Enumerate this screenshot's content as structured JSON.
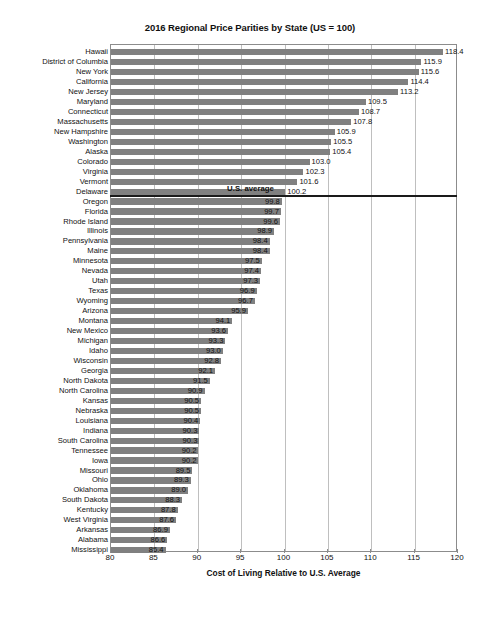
{
  "chart_data": {
    "type": "bar",
    "orientation": "horizontal",
    "title": "2016 Regional Price Parities by State (US = 100)",
    "xlabel": "Cost of Living Relative to U.S. Average",
    "ylabel": "",
    "xlim": [
      80,
      120
    ],
    "xticks": [
      80,
      85,
      90,
      95,
      100,
      105,
      110,
      115,
      120
    ],
    "grid": "vertical",
    "legend": "none",
    "bar_color": "#808080",
    "baseline": 80,
    "annotations": [
      {
        "text": "U.S. average",
        "value": 100,
        "type": "divider-line"
      }
    ],
    "categories": [
      "Hawaii",
      "District of Columbia",
      "New York",
      "California",
      "New Jersey",
      "Maryland",
      "Connecticut",
      "Massachusetts",
      "New Hampshire",
      "Washington",
      "Alaska",
      "Colorado",
      "Virginia",
      "Vermont",
      "Delaware",
      "Oregon",
      "Florida",
      "Rhode Island",
      "Illinois",
      "Pennsylvania",
      "Maine",
      "Minnesota",
      "Nevada",
      "Utah",
      "Texas",
      "Wyoming",
      "Arizona",
      "Montana",
      "New Mexico",
      "Michigan",
      "Idaho",
      "Wisconsin",
      "Georgia",
      "North Dakota",
      "North Carolina",
      "Kansas",
      "Nebraska",
      "Louisiana",
      "Indiana",
      "South Carolina",
      "Tennessee",
      "Iowa",
      "Missouri",
      "Ohio",
      "Oklahoma",
      "South Dakota",
      "Kentucky",
      "West Virginia",
      "Arkansas",
      "Alabama",
      "Mississippi"
    ],
    "values": [
      118.4,
      115.9,
      115.6,
      114.4,
      113.2,
      109.5,
      108.7,
      107.8,
      105.9,
      105.5,
      105.4,
      103.0,
      102.3,
      101.6,
      100.2,
      99.8,
      99.7,
      99.6,
      98.9,
      98.4,
      98.4,
      97.5,
      97.4,
      97.3,
      96.9,
      96.7,
      95.9,
      94.1,
      93.6,
      93.3,
      93.0,
      92.8,
      92.1,
      91.5,
      90.9,
      90.5,
      90.5,
      90.4,
      90.3,
      90.3,
      90.2,
      90.2,
      89.5,
      89.3,
      89.0,
      88.3,
      87.8,
      87.6,
      86.9,
      86.6,
      86.4
    ],
    "value_labels": [
      "118.4",
      "115.9",
      "115.6",
      "114.4",
      "113.2",
      "109.5",
      "108.7",
      "107.8",
      "105.9",
      "105.5",
      "105.4",
      "103.0",
      "102.3",
      "101.6",
      "100.2",
      "99.8",
      "99.7",
      "99.6",
      "98.9",
      "98.4",
      "98.4",
      "97.5",
      "97.4",
      "97.3",
      "96.9",
      "96.7",
      "95.9",
      "94.1",
      "93.6",
      "93.3",
      "93.0",
      "92.8",
      "92.1",
      "91.5",
      "90.9",
      "90.5",
      "90.5",
      "90.4",
      "90.3",
      "90.3",
      "90.2",
      "90.2",
      "89.5",
      "89.3",
      "89.0",
      "88.3",
      "87.8",
      "87.6",
      "86.9",
      "86.6",
      "86.4"
    ]
  }
}
